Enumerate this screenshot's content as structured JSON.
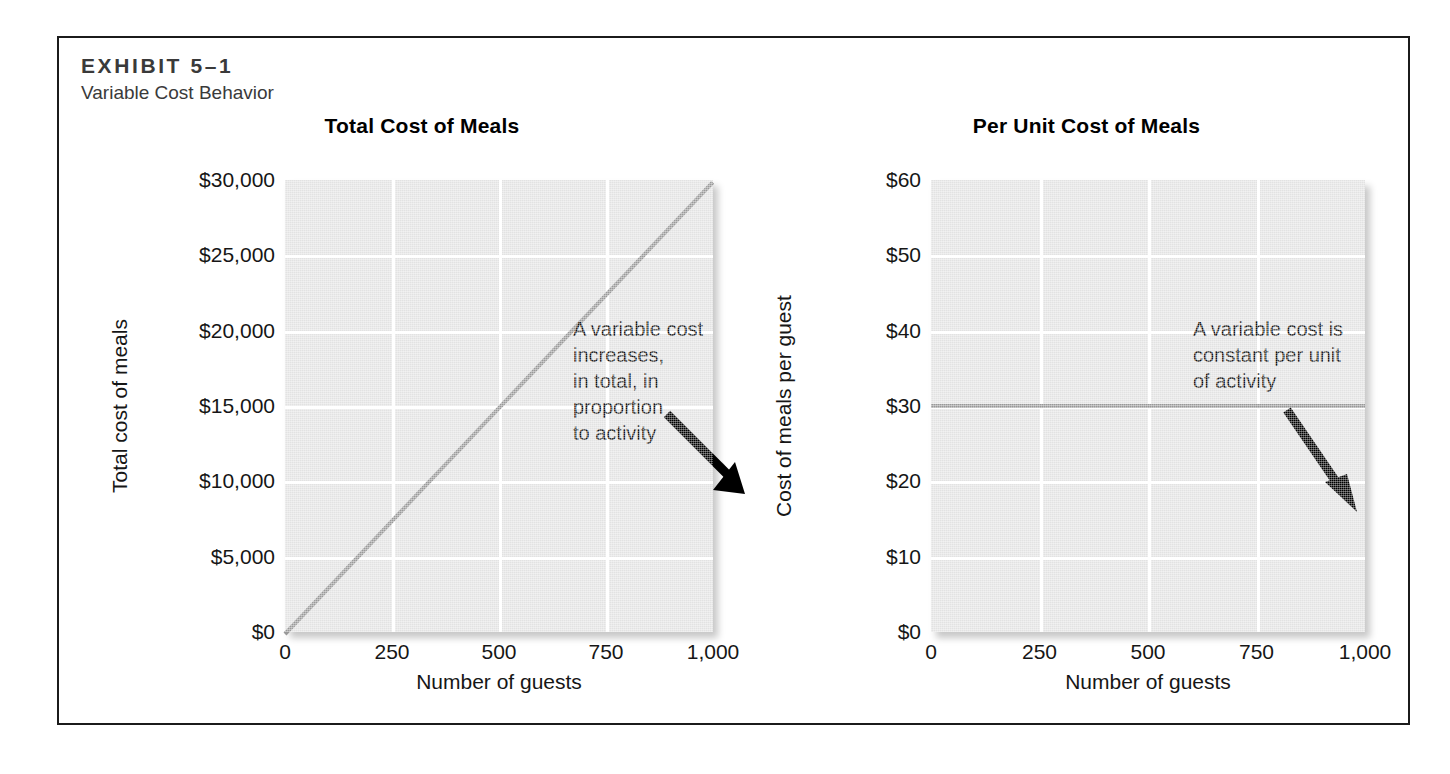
{
  "exhibit": {
    "label": "EXHIBIT 5–1",
    "subtitle": "Variable Cost Behavior"
  },
  "colors": {
    "plot_background": "#e2e2e2",
    "gridline": "#ffffff",
    "data_line": "#999999",
    "frame_border": "#1b1b1b",
    "text": "#161616",
    "arrow": "#000000"
  },
  "charts": [
    {
      "id": "total-cost-of-meals",
      "title": "Total Cost of Meals",
      "xlabel": "Number of guests",
      "ylabel": "Total cost of meals",
      "yticks": [
        "$30,000",
        "$25,000",
        "$20,000",
        "$15,000",
        "$10,000",
        "$5,000",
        "$0"
      ],
      "xticks": [
        "0",
        "250",
        "500",
        "750",
        "1,000"
      ],
      "annotation": "A variable cost increases,\nin total, in proportion\nto activity"
    },
    {
      "id": "per-unit-cost-of-meals",
      "title": "Per Unit Cost of Meals",
      "xlabel": "Number of guests",
      "ylabel": "Cost of meals per guest",
      "yticks": [
        "$60",
        "$50",
        "$40",
        "$30",
        "$20",
        "$10",
        "$0"
      ],
      "xticks": [
        "0",
        "250",
        "500",
        "750",
        "1,000"
      ],
      "annotation": "A variable cost is\nconstant per unit\nof activity"
    }
  ],
  "chart_data": [
    {
      "type": "line",
      "title": "Total Cost of Meals",
      "xlabel": "Number of guests",
      "ylabel": "Total cost of meals",
      "xlim": [
        0,
        1000
      ],
      "ylim": [
        0,
        30000
      ],
      "xticks": [
        0,
        250,
        500,
        750,
        1000
      ],
      "yticks": [
        0,
        5000,
        10000,
        15000,
        20000,
        25000,
        30000
      ],
      "xtick_labels": [
        "0",
        "250",
        "500",
        "750",
        "1,000"
      ],
      "ytick_labels": [
        "$0",
        "$5,000",
        "$10,000",
        "$15,000",
        "$20,000",
        "$25,000",
        "$30,000"
      ],
      "grid": true,
      "legend": "none",
      "series": [
        {
          "name": "Total cost of meals",
          "x": [
            0,
            250,
            500,
            750,
            1000
          ],
          "values": [
            0,
            7500,
            15000,
            22500,
            30000
          ],
          "color": "#999999"
        }
      ],
      "annotations": [
        {
          "text": "A variable cost increases, in total, in proportion to activity",
          "points_to": [
            530,
            16000
          ]
        }
      ]
    },
    {
      "type": "line",
      "title": "Per Unit Cost of Meals",
      "xlabel": "Number of guests",
      "ylabel": "Cost of meals per guest",
      "xlim": [
        0,
        1000
      ],
      "ylim": [
        0,
        60
      ],
      "xticks": [
        0,
        250,
        500,
        750,
        1000
      ],
      "yticks": [
        0,
        10,
        20,
        30,
        40,
        50,
        60
      ],
      "xtick_labels": [
        "0",
        "250",
        "500",
        "750",
        "1,000"
      ],
      "ytick_labels": [
        "$0",
        "$10",
        "$20",
        "$30",
        "$40",
        "$50",
        "$60"
      ],
      "grid": true,
      "legend": "none",
      "series": [
        {
          "name": "Cost of meals per guest",
          "x": [
            0,
            250,
            500,
            750,
            1000
          ],
          "values": [
            30,
            30,
            30,
            30,
            30
          ],
          "color": "#999999"
        }
      ],
      "annotations": [
        {
          "text": "A variable cost is constant per unit of activity",
          "points_to": [
            500,
            30
          ]
        }
      ]
    }
  ]
}
